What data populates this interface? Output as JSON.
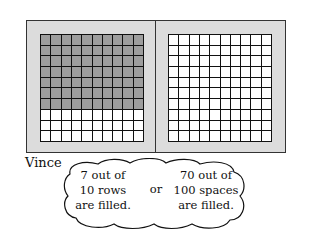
{
  "grids": [
    {
      "name": "left-grid",
      "rows": 10,
      "cols": 10,
      "filled_rows": 7,
      "fill_color": "#9e9e9e"
    },
    {
      "name": "right-grid",
      "rows": 10,
      "cols": 10,
      "filled_rows": 0,
      "fill_color": "#9e9e9e"
    }
  ],
  "speaker": "Vince",
  "bubble": {
    "left_text": [
      "7 out of",
      "10 rows",
      "are filled."
    ],
    "connector": "or",
    "right_text": [
      "70 out of",
      "100 spaces",
      "are filled."
    ]
  }
}
